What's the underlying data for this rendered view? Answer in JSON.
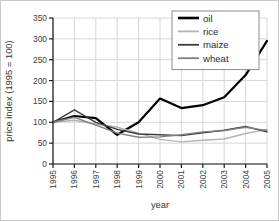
{
  "figure": {
    "background": "#ffffff",
    "border_color": "#c9c9c9"
  },
  "chart_data": {
    "type": "line",
    "title": "",
    "xlabel": "year",
    "ylabel": "price index (1995 = 100)",
    "x_categories": [
      "1995",
      "1996",
      "1997",
      "1998",
      "1999",
      "2000",
      "2001",
      "2002",
      "2003",
      "2004",
      "2005"
    ],
    "y_ticks": [
      0,
      50,
      100,
      150,
      200,
      250,
      300,
      350
    ],
    "ylim": [
      0,
      350
    ],
    "grid": true,
    "grid_color": "#d6d6d6",
    "axis_color": "#1a1a1a",
    "tick_label_color": "#3d3d3d",
    "legend_position": "top-right",
    "series": [
      {
        "name": "oil",
        "color": "#000000",
        "width": 2.2,
        "values": [
          100,
          115,
          110,
          70,
          100,
          157,
          134,
          141,
          160,
          213,
          295
        ]
      },
      {
        "name": "rice",
        "color": "#b3b3b3",
        "width": 1.4,
        "values": [
          100,
          105,
          96,
          88,
          74,
          59,
          53,
          57,
          60,
          73,
          83
        ]
      },
      {
        "name": "maize",
        "color": "#3d3d3d",
        "width": 1.4,
        "values": [
          100,
          130,
          100,
          83,
          72,
          70,
          68,
          75,
          81,
          90,
          77
        ]
      },
      {
        "name": "wheat",
        "color": "#808080",
        "width": 1.4,
        "values": [
          100,
          112,
          93,
          74,
          64,
          65,
          70,
          77,
          80,
          88,
          80
        ]
      }
    ]
  }
}
